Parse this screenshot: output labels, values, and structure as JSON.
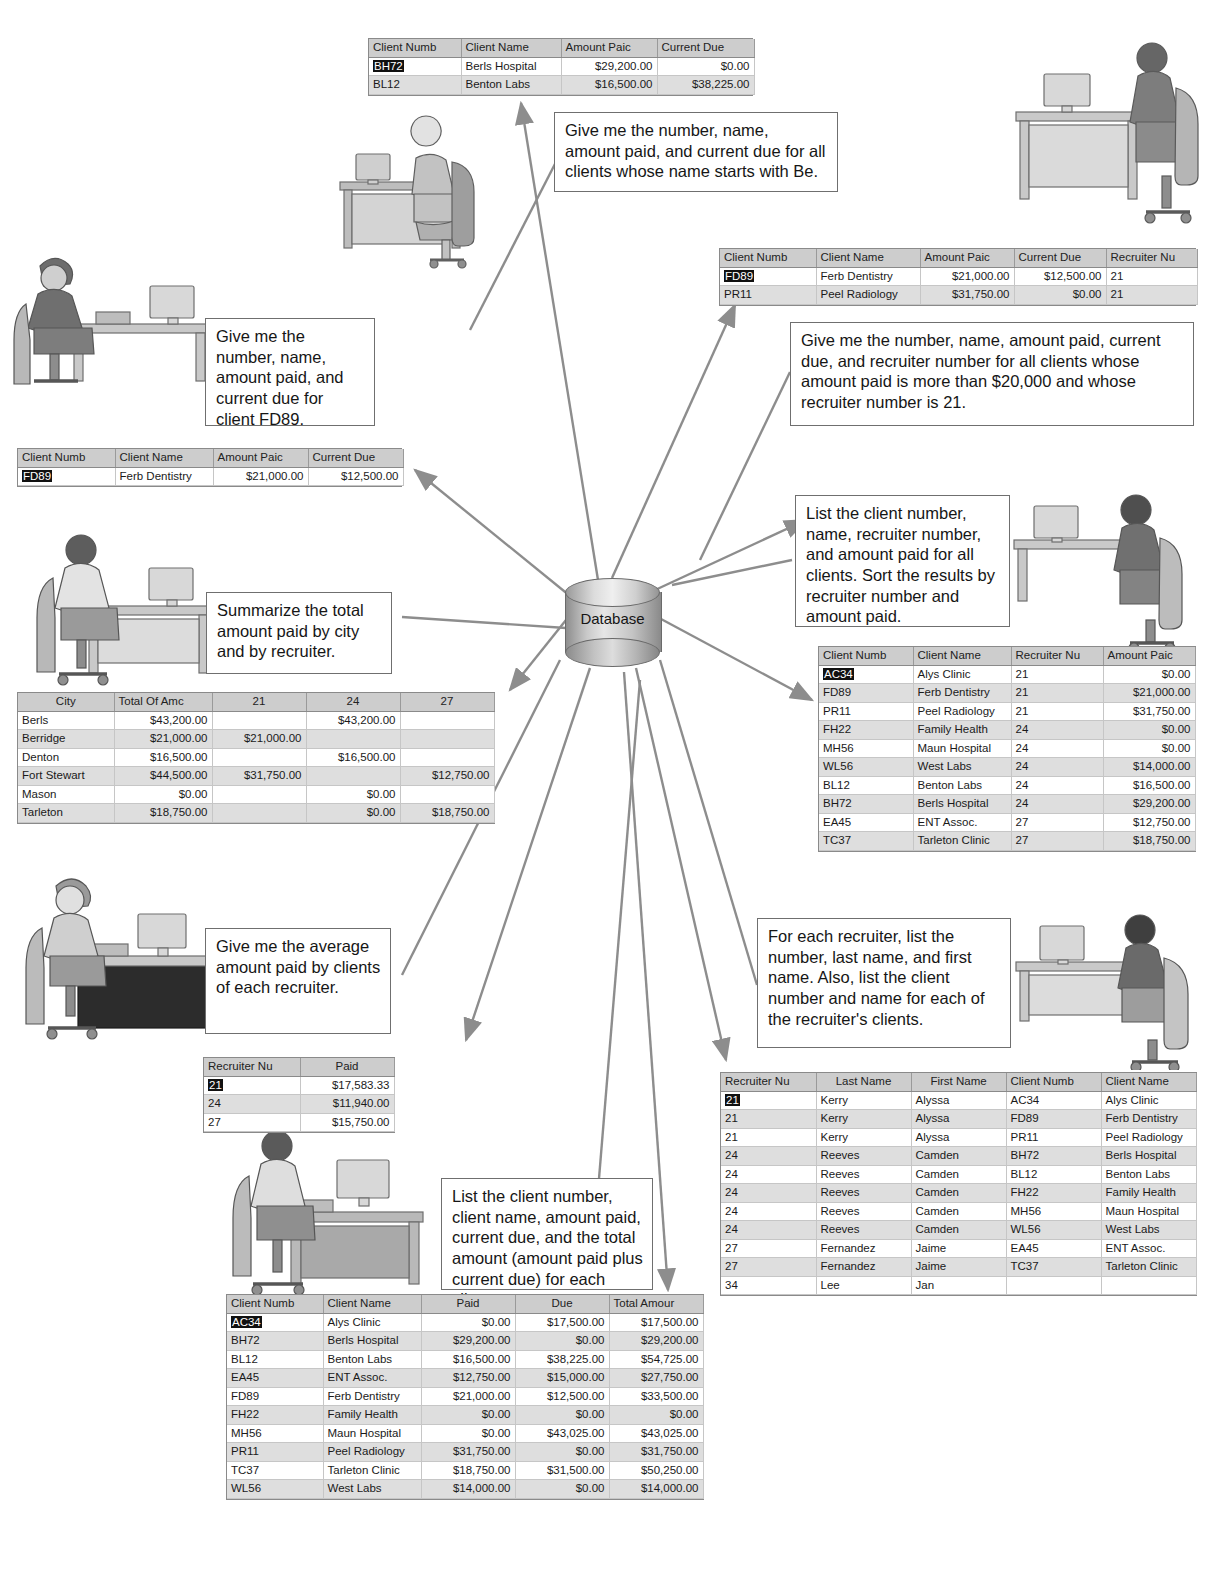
{
  "diagram": {
    "center_label": "Database"
  },
  "queries": [
    {
      "id": "q-starts-with-be",
      "text": "Give me the number, name, amount paid, and current due for all clients whose name starts with Be."
    },
    {
      "id": "q-client-fd89",
      "text": "Give me the number, name, amount paid, and current due for client FD89."
    },
    {
      "id": "q-paid-over-20000",
      "text": "Give me the number, name, amount paid, current due, and recruiter number for all clients whose amount paid is more than $20,000 and whose recruiter number is 21."
    },
    {
      "id": "q-sorted-list",
      "text": "List the client number, name, recruiter number, and amount paid for all clients. Sort the results by recruiter number and amount paid."
    },
    {
      "id": "q-summarize-city",
      "text": "Summarize the total amount paid by city and by recruiter."
    },
    {
      "id": "q-average-paid",
      "text": "Give me the average amount paid by clients of each recruiter."
    },
    {
      "id": "q-recruiter-clients",
      "text": "For each recruiter, list the number, last name, and first name. Also, list the client number and name for each of the recruiter's clients."
    },
    {
      "id": "q-total-amount",
      "text": "List the client number, client name, amount paid, current due, and the total amount (amount paid plus current due) for each client."
    }
  ],
  "tables": {
    "starts_with_be": {
      "name": "starts-with-be-results",
      "columns": [
        "Client Numb",
        "Client Name",
        "Amount Paic",
        "Current Due"
      ],
      "rows": [
        [
          "BH72",
          "Berls Hospital",
          "$29,200.00",
          "$0.00"
        ],
        [
          "BL12",
          "Benton Labs",
          "$16,500.00",
          "$38,225.00"
        ]
      ]
    },
    "paid_over_20000": {
      "name": "paid-over-20000-results",
      "columns": [
        "Client Numb",
        "Client Name",
        "Amount Paic",
        "Current Due",
        "Recruiter Nu"
      ],
      "rows": [
        [
          "FD89",
          "Ferb Dentistry",
          "$21,000.00",
          "$12,500.00",
          "21"
        ],
        [
          "PR11",
          "Peel Radiology",
          "$31,750.00",
          "$0.00",
          "21"
        ]
      ]
    },
    "client_fd89": {
      "name": "client-fd89-results",
      "columns": [
        "Client Numb",
        "Client Name",
        "Amount Paic",
        "Current Due"
      ],
      "rows": [
        [
          "FD89",
          "Ferb Dentistry",
          "$21,000.00",
          "$12,500.00"
        ]
      ]
    },
    "city_crosstab": {
      "name": "city-crosstab-results",
      "columns": [
        "City",
        "Total Of Amc",
        "21",
        "24",
        "27"
      ],
      "rows": [
        [
          "Berls",
          "$43,200.00",
          "",
          "$43,200.00",
          ""
        ],
        [
          "Berridge",
          "$21,000.00",
          "$21,000.00",
          "",
          ""
        ],
        [
          "Denton",
          "$16,500.00",
          "",
          "$16,500.00",
          ""
        ],
        [
          "Fort Stewart",
          "$44,500.00",
          "$31,750.00",
          "",
          "$12,750.00"
        ],
        [
          "Mason",
          "$0.00",
          "",
          "$0.00",
          ""
        ],
        [
          "Tarleton",
          "$18,750.00",
          "",
          "$0.00",
          "$18,750.00"
        ]
      ]
    },
    "sorted_clients": {
      "name": "sorted-clients-results",
      "columns": [
        "Client Numb",
        "Client Name",
        "Recruiter Nu",
        "Amount Paic"
      ],
      "rows": [
        [
          "AC34",
          "Alys Clinic",
          "21",
          "$0.00"
        ],
        [
          "FD89",
          "Ferb Dentistry",
          "21",
          "$21,000.00"
        ],
        [
          "PR11",
          "Peel Radiology",
          "21",
          "$31,750.00"
        ],
        [
          "FH22",
          "Family Health",
          "24",
          "$0.00"
        ],
        [
          "MH56",
          "Maun Hospital",
          "24",
          "$0.00"
        ],
        [
          "WL56",
          "West Labs",
          "24",
          "$14,000.00"
        ],
        [
          "BL12",
          "Benton Labs",
          "24",
          "$16,500.00"
        ],
        [
          "BH72",
          "Berls Hospital",
          "24",
          "$29,200.00"
        ],
        [
          "EA45",
          "ENT Assoc.",
          "27",
          "$12,750.00"
        ],
        [
          "TC37",
          "Tarleton Clinic",
          "27",
          "$18,750.00"
        ]
      ]
    },
    "average_paid": {
      "name": "average-paid-results",
      "columns": [
        "Recruiter Nu",
        "Paid"
      ],
      "rows": [
        [
          "21",
          "$17,583.33"
        ],
        [
          "24",
          "$11,940.00"
        ],
        [
          "27",
          "$15,750.00"
        ]
      ]
    },
    "recruiter_clients": {
      "name": "recruiter-clients-results",
      "columns": [
        "Recruiter Nu",
        "Last Name",
        "First Name",
        "Client Numb",
        "Client Name"
      ],
      "rows": [
        [
          "21",
          "Kerry",
          "Alyssa",
          "AC34",
          "Alys Clinic"
        ],
        [
          "21",
          "Kerry",
          "Alyssa",
          "FD89",
          "Ferb Dentistry"
        ],
        [
          "21",
          "Kerry",
          "Alyssa",
          "PR11",
          "Peel Radiology"
        ],
        [
          "24",
          "Reeves",
          "Camden",
          "BH72",
          "Berls Hospital"
        ],
        [
          "24",
          "Reeves",
          "Camden",
          "BL12",
          "Benton Labs"
        ],
        [
          "24",
          "Reeves",
          "Camden",
          "FH22",
          "Family Health"
        ],
        [
          "24",
          "Reeves",
          "Camden",
          "MH56",
          "Maun Hospital"
        ],
        [
          "24",
          "Reeves",
          "Camden",
          "WL56",
          "West Labs"
        ],
        [
          "27",
          "Fernandez",
          "Jaime",
          "EA45",
          "ENT Assoc."
        ],
        [
          "27",
          "Fernandez",
          "Jaime",
          "TC37",
          "Tarleton Clinic"
        ],
        [
          "34",
          "Lee",
          "Jan",
          "",
          ""
        ]
      ]
    },
    "total_amount": {
      "name": "total-amount-results",
      "columns": [
        "Client Numb",
        "Client Name",
        "Paid",
        "Due",
        "Total Amour"
      ],
      "rows": [
        [
          "AC34",
          "Alys Clinic",
          "$0.00",
          "$17,500.00",
          "$17,500.00"
        ],
        [
          "BH72",
          "Berls Hospital",
          "$29,200.00",
          "$0.00",
          "$29,200.00"
        ],
        [
          "BL12",
          "Benton Labs",
          "$16,500.00",
          "$38,225.00",
          "$54,725.00"
        ],
        [
          "EA45",
          "ENT Assoc.",
          "$12,750.00",
          "$15,000.00",
          "$27,750.00"
        ],
        [
          "FD89",
          "Ferb Dentistry",
          "$21,000.00",
          "$12,500.00",
          "$33,500.00"
        ],
        [
          "FH22",
          "Family Health",
          "$0.00",
          "$0.00",
          "$0.00"
        ],
        [
          "MH56",
          "Maun Hospital",
          "$0.00",
          "$43,025.00",
          "$43,025.00"
        ],
        [
          "PR11",
          "Peel Radiology",
          "$31,750.00",
          "$0.00",
          "$31,750.00"
        ],
        [
          "TC37",
          "Tarleton Clinic",
          "$18,750.00",
          "$31,500.00",
          "$50,250.00"
        ],
        [
          "WL56",
          "West Labs",
          "$14,000.00",
          "$0.00",
          "$14,000.00"
        ]
      ]
    }
  }
}
